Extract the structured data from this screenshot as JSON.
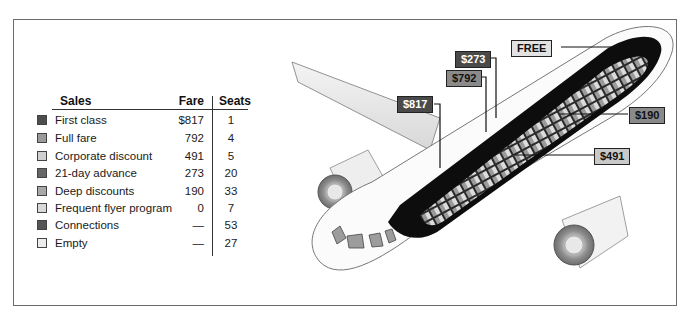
{
  "legend": {
    "headers": {
      "sales": "Sales",
      "fare": "Fare",
      "seats": "Seats"
    },
    "rows": [
      {
        "label": "First class",
        "fare": "$817",
        "seats": "1",
        "color": "#4d4d4d"
      },
      {
        "label": "Full fare",
        "fare": "792",
        "seats": "4",
        "color": "#9a9a9a"
      },
      {
        "label": "Corporate discount",
        "fare": "491",
        "seats": "5",
        "color": "#d0d0d0"
      },
      {
        "label": "21-day advance",
        "fare": "273",
        "seats": "20",
        "color": "#666666"
      },
      {
        "label": "Deep discounts",
        "fare": "190",
        "seats": "33",
        "color": "#a8a8a8"
      },
      {
        "label": "Frequent flyer program",
        "fare": "0",
        "seats": "7",
        "color": "#d8d8d8"
      },
      {
        "label": "Connections",
        "fare": "—",
        "seats": "53",
        "color": "#555555"
      },
      {
        "label": "Empty",
        "fare": "—",
        "seats": "27",
        "color": "#ececec"
      }
    ]
  },
  "callouts": [
    {
      "label": "$273",
      "style": "dark"
    },
    {
      "label": "FREE",
      "style": "vlight"
    },
    {
      "label": "$792",
      "style": "mid"
    },
    {
      "label": "$817",
      "style": "dark"
    },
    {
      "label": "$190",
      "style": "mid"
    },
    {
      "label": "$491",
      "style": "light"
    }
  ]
}
